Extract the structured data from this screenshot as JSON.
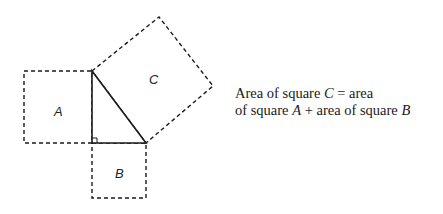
{
  "diagram": {
    "squares": [
      {
        "label": "A",
        "points": [
          [
            24,
            71
          ],
          [
            92,
            71
          ],
          [
            92,
            143
          ],
          [
            24,
            143
          ]
        ],
        "label_pos": [
          58,
          111
        ]
      },
      {
        "label": "B",
        "points": [
          [
            92,
            143
          ],
          [
            146,
            143
          ],
          [
            146,
            198
          ],
          [
            92,
            198
          ]
        ],
        "label_pos": [
          119,
          174
        ]
      },
      {
        "label": "C",
        "points": [
          [
            92,
            71
          ],
          [
            159,
            17
          ],
          [
            213,
            86
          ],
          [
            146,
            143
          ]
        ],
        "label_pos": [
          153,
          83
        ]
      }
    ],
    "triangle": {
      "points": [
        [
          92,
          71
        ],
        [
          92,
          143
        ],
        [
          146,
          143
        ]
      ],
      "right_angle_at": [
        92,
        143
      ]
    },
    "colors": {
      "stroke": "#1a1a1a"
    }
  },
  "caption": {
    "line1_prefix": "Area of square ",
    "line1_var": "C",
    "line1_suffix": " = area",
    "line2_prefix": "of square ",
    "line2_var1": "A",
    "line2_mid": " + area of square ",
    "line2_var2": "B"
  }
}
